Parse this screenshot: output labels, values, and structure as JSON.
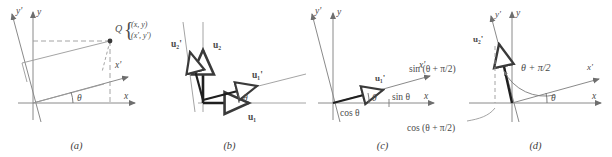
{
  "figure": {
    "panels": [
      {
        "caption": "(a)",
        "axes": [
          "y'",
          "y",
          "x'",
          "x"
        ],
        "angle_label": "θ",
        "point_label": "Q",
        "coords_primary": "(x, y)",
        "coords_rotated": "(x', y')"
      },
      {
        "caption": "(b)",
        "angle_label": "θ",
        "vectors": [
          "u₂'",
          "u₂",
          "u₁'",
          "u₁"
        ]
      },
      {
        "caption": "(c)",
        "axes": [
          "y'",
          "y",
          "x'",
          "x"
        ],
        "angle_label": "θ",
        "vector_label": "u₁'",
        "cos_label": "cos θ",
        "sin_label": "sin θ"
      },
      {
        "caption": "(d)",
        "axes": [
          "y'",
          "y",
          "x'",
          "x"
        ],
        "angle_label": "θ",
        "vector_label": "u₂'",
        "big_angle": "θ + π/2",
        "sin_label": "sin (θ + π/2)",
        "cos_label": "cos (θ + π/2)"
      }
    ],
    "colors": {
      "axis": "#8a8a8a",
      "accent_dark": "#2e2e2e",
      "text": "#4a4a4a",
      "background": "#ffffff"
    }
  }
}
